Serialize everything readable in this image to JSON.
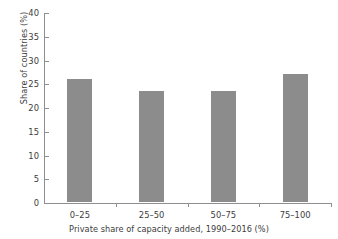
{
  "chart_data": {
    "type": "bar",
    "title": "",
    "categories": [
      "0–25",
      "25–50",
      "50–75",
      "75–100"
    ],
    "values": [
      25.9,
      23.4,
      23.4,
      26.9
    ],
    "xlabel": "Private share of capacity added, 1990–2016 (%)",
    "ylabel": "Share of countries (%)",
    "ylim": [
      0,
      40
    ],
    "yticks": [
      "0",
      "5",
      "10",
      "15",
      "20",
      "25",
      "30",
      "35",
      "40"
    ],
    "ytick_values": [
      0,
      5,
      10,
      15,
      20,
      25,
      30,
      35,
      40
    ],
    "grid": false,
    "legend": false,
    "legend_position": "none",
    "bar_color": "#8c8c8c",
    "axis_color": "#8f8f8f",
    "text_color": "#3d3d3d",
    "background_color": "#ffffff"
  }
}
